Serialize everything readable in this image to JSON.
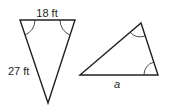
{
  "figure": {
    "left_triangle": {
      "top_side_label": "18 ft",
      "left_side_label": "27 ft",
      "marked_angles": 2
    },
    "right_triangle": {
      "bottom_side_label": "a",
      "marked_angles": 2
    },
    "stroke_color": "#231f20"
  }
}
